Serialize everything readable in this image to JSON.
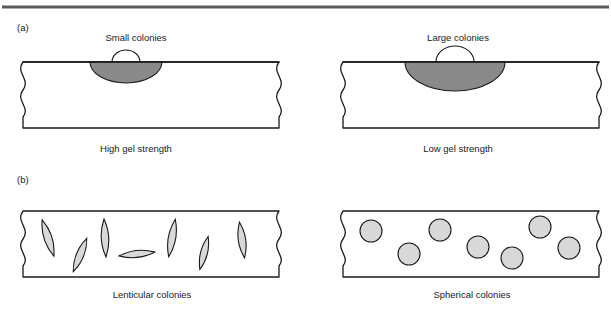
{
  "figure": {
    "width": 611,
    "height": 313,
    "background": "#ffffff",
    "top_rule_color": "#5a5a5a"
  },
  "colors": {
    "outline": "#1a1a1a",
    "dome_fill": "#8a8a8a",
    "colony_fill": "#d8d8d8",
    "slab_fill": "#ffffff",
    "text": "#1a1a1a"
  },
  "panels": [
    {
      "id": "panel-a",
      "label": "(a)",
      "label_x": 17,
      "label_y": 31,
      "sub_panels": [
        {
          "id": "panel-a-left",
          "colony_label": "Small colonies",
          "colony_label_x": 136,
          "colony_label_y": 41,
          "caption": "High gel strength",
          "caption_x": 136,
          "caption_y": 152,
          "slab": {
            "x": 23,
            "y": 62,
            "w": 256,
            "h": 66
          },
          "dome": {
            "cx": 126,
            "cy": 62,
            "lower_rx": 36,
            "lower_ry": 21,
            "upper_rx": 14,
            "upper_ry": 12
          }
        },
        {
          "id": "panel-a-right",
          "colony_label": "Large colonies",
          "colony_label_x": 458,
          "colony_label_y": 41,
          "caption": "Low gel strength",
          "caption_x": 458,
          "caption_y": 152,
          "slab": {
            "x": 343,
            "y": 62,
            "w": 256,
            "h": 66
          },
          "dome": {
            "cx": 455,
            "cy": 62,
            "lower_rx": 50,
            "lower_ry": 29,
            "upper_rx": 19,
            "upper_ry": 16
          }
        }
      ]
    },
    {
      "id": "panel-b",
      "label": "(b)",
      "label_x": 17,
      "label_y": 183,
      "sub_panels": [
        {
          "id": "panel-b-left",
          "caption": "Lenticular colonies",
          "caption_x": 152,
          "caption_y": 298,
          "slab": {
            "x": 23,
            "y": 211,
            "w": 256,
            "h": 66
          },
          "colony_type": "lenticular",
          "colonies": [
            {
              "cx": 48,
              "cy": 238,
              "rx": 8,
              "ry": 19,
              "rot": -18
            },
            {
              "cx": 80,
              "cy": 255,
              "rx": 7.5,
              "ry": 18,
              "rot": 22
            },
            {
              "cx": 105,
              "cy": 238,
              "rx": 7.5,
              "ry": 19,
              "rot": -3
            },
            {
              "cx": 137,
              "cy": 254,
              "rx": 18,
              "ry": 7,
              "rot": -6
            },
            {
              "cx": 172,
              "cy": 238,
              "rx": 7.5,
              "ry": 19,
              "rot": 10
            },
            {
              "cx": 204,
              "cy": 253,
              "rx": 7,
              "ry": 17,
              "rot": 14
            },
            {
              "cx": 242,
              "cy": 240,
              "rx": 7.5,
              "ry": 18,
              "rot": -8
            }
          ]
        },
        {
          "id": "panel-b-right",
          "caption": "Spherical colonies",
          "caption_x": 472,
          "caption_y": 298,
          "slab": {
            "x": 343,
            "y": 211,
            "w": 256,
            "h": 66
          },
          "colony_type": "spherical",
          "colonies": [
            {
              "cx": 371,
              "cy": 231,
              "r": 11
            },
            {
              "cx": 409,
              "cy": 254,
              "r": 11
            },
            {
              "cx": 440,
              "cy": 230,
              "r": 11
            },
            {
              "cx": 478,
              "cy": 247,
              "r": 11
            },
            {
              "cx": 512,
              "cy": 258,
              "r": 11
            },
            {
              "cx": 540,
              "cy": 227,
              "r": 11
            },
            {
              "cx": 569,
              "cy": 248,
              "r": 11
            }
          ]
        }
      ]
    }
  ]
}
